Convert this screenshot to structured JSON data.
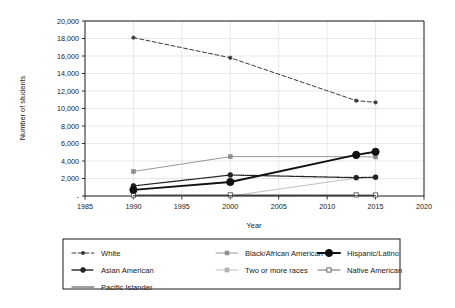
{
  "chart_data": {
    "type": "line",
    "title": "",
    "xlabel": "Year",
    "ylabel": "Number of students",
    "x": [
      1990,
      2000,
      2013,
      2015
    ],
    "xlim": [
      1985,
      2020
    ],
    "ylim": [
      0,
      20000
    ],
    "xticks": [
      "1985",
      "1990",
      "1995",
      "2000",
      "2005",
      "2010",
      "2015",
      "2020"
    ],
    "xtick_values": [
      1985,
      1990,
      1995,
      2000,
      2005,
      2010,
      2015,
      2020
    ],
    "yticks": [
      "-",
      "2,000",
      "4,000",
      "6,000",
      "8,000",
      "10,000",
      "12,000",
      "14,000",
      "16,000",
      "18,000",
      "20,000"
    ],
    "ytick_values": [
      0,
      2000,
      4000,
      6000,
      8000,
      10000,
      12000,
      14000,
      16000,
      18000,
      20000
    ],
    "grid": true,
    "legend_position": "bottom",
    "series": [
      {
        "name": "White",
        "style": "dashed",
        "marker": "circle-small",
        "color": "#3a3a3a",
        "x": [
          1990,
          2000,
          2013,
          2015
        ],
        "values": [
          18100,
          15800,
          10900,
          10700
        ]
      },
      {
        "name": "Black/African American",
        "style": "solid",
        "marker": "square",
        "color": "#8c8c8c",
        "x": [
          1990,
          2000,
          2013,
          2015
        ],
        "values": [
          2800,
          4500,
          4500,
          4450
        ]
      },
      {
        "name": "Hispanic/Latino",
        "style": "solid-thick",
        "marker": "circle-large",
        "color": "#111111",
        "x": [
          1990,
          2000,
          2013,
          2015
        ],
        "values": [
          700,
          1600,
          4700,
          5050
        ]
      },
      {
        "name": "Asian American",
        "style": "dotted",
        "marker": "circle-medium",
        "color": "#222222",
        "x": [
          1990,
          2000,
          2013,
          2015
        ],
        "values": [
          1150,
          2400,
          2100,
          2150
        ]
      },
      {
        "name": "Two or more races",
        "style": "solid",
        "marker": "square-light",
        "color": "#b8b8b8",
        "x": [
          1990,
          2000,
          2013,
          2015
        ],
        "values": [
          0,
          0,
          2050,
          2100
        ]
      },
      {
        "name": "Native American",
        "style": "solid",
        "marker": "square-open",
        "color": "#5a5a5a",
        "x": [
          1990,
          2000,
          2013,
          2015
        ],
        "values": [
          120,
          130,
          120,
          110
        ]
      },
      {
        "name": "Pacific Islander",
        "style": "solid",
        "marker": "none",
        "color": "#2a2a2a",
        "x": [
          1990,
          2000,
          2013,
          2015
        ],
        "values": [
          40,
          40,
          40,
          40
        ]
      }
    ]
  },
  "legend": {
    "entries": [
      {
        "label": "White",
        "key": "white"
      },
      {
        "label": "Black/African American",
        "key": "black-african-american"
      },
      {
        "label": "Hispanic/Latino",
        "key": "hispanic-latino"
      },
      {
        "label": "Asian American",
        "key": "asian-american"
      },
      {
        "label": "Two or more races",
        "key": "two-or-more-races"
      },
      {
        "label": "Native American",
        "key": "native-american"
      },
      {
        "label": "Pacific Islander",
        "key": "pacific-islander"
      }
    ]
  }
}
